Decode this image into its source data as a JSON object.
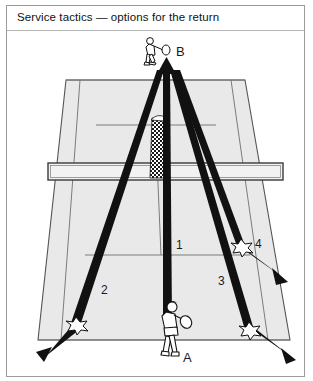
{
  "figure": {
    "title": "Service tactics  —  options for the return",
    "width": 313,
    "height": 381,
    "frame_color": "#9b9b9b",
    "background": "#ffffff"
  },
  "court": {
    "surface_color": "#e9e9e9",
    "line_color": "#6f6f6f",
    "net_fill": "#f2f2f2",
    "net_line_color": "#3a3a3a"
  },
  "players": [
    {
      "id": "player-b",
      "label": "B",
      "position": "far side, behind baseline, center",
      "label_x": 176,
      "label_y": 52
    },
    {
      "id": "player-a",
      "label": "A",
      "position": "near side, behind baseline, center",
      "label_x": 183,
      "label_y": 358
    }
  ],
  "serve": {
    "id": "serve-trajectory",
    "style": "stippled",
    "description": "serve travelling from A across the net into B's service court"
  },
  "return_options": [
    {
      "number": "1",
      "label_x": 176,
      "label_y": 246,
      "description": "return driven straight down the middle",
      "stroke_color": "#111111"
    },
    {
      "number": "2",
      "label_x": 101,
      "label_y": 291,
      "description": "return angled cross-court to the left, bouncing on the sideline",
      "stroke_color": "#111111"
    },
    {
      "number": "3",
      "label_x": 218,
      "label_y": 282,
      "description": "return angled cross-court to the right, bouncing on the sideline",
      "stroke_color": "#111111"
    },
    {
      "number": "4",
      "label_x": 255,
      "label_y": 245,
      "description": "short sharply angled return landing near the service line",
      "stroke_color": "#111111"
    }
  ],
  "bounce_marks": [
    {
      "id": "bounce-option-2",
      "x": 76,
      "y": 325
    },
    {
      "id": "bounce-option-3",
      "x": 249,
      "y": 330
    },
    {
      "id": "bounce-option-4",
      "x": 241,
      "y": 247
    }
  ]
}
